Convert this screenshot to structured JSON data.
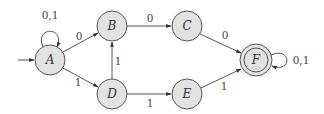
{
  "diagram": {
    "type": "finite-automaton",
    "start_state": "A",
    "accept_states": [
      "F"
    ],
    "states": [
      {
        "id": "A",
        "label": "A",
        "x": 50,
        "y": 60,
        "accept": false
      },
      {
        "id": "B",
        "label": "B",
        "x": 112,
        "y": 26,
        "accept": false
      },
      {
        "id": "C",
        "label": "C",
        "x": 187,
        "y": 26,
        "accept": false
      },
      {
        "id": "D",
        "label": "D",
        "x": 112,
        "y": 94,
        "accept": false
      },
      {
        "id": "E",
        "label": "E",
        "x": 187,
        "y": 94,
        "accept": false
      },
      {
        "id": "F",
        "label": "F",
        "x": 256,
        "y": 60,
        "accept": true
      }
    ],
    "transitions": [
      {
        "from": "A",
        "to": "A",
        "label": "0,1"
      },
      {
        "from": "A",
        "to": "B",
        "label": "0"
      },
      {
        "from": "A",
        "to": "D",
        "label": "1"
      },
      {
        "from": "D",
        "to": "B",
        "label": "1"
      },
      {
        "from": "B",
        "to": "C",
        "label": "0"
      },
      {
        "from": "D",
        "to": "E",
        "label": "1"
      },
      {
        "from": "C",
        "to": "F",
        "label": "0"
      },
      {
        "from": "E",
        "to": "F",
        "label": "1"
      },
      {
        "from": "F",
        "to": "F",
        "label": "0,1"
      }
    ],
    "labels": {
      "state_A": "A",
      "state_B": "B",
      "state_C": "C",
      "state_D": "D",
      "state_E": "E",
      "state_F": "F",
      "loop_A": "0,1",
      "edge_AB": "0",
      "edge_AD": "1",
      "edge_DB": "1",
      "edge_BC": "0",
      "edge_DE": "1",
      "edge_CF": "0",
      "edge_EF": "1",
      "loop_F": "0,1"
    },
    "colors": {
      "state_fill": "#e2e2e2",
      "stroke": "#555555",
      "text": "#333333"
    }
  }
}
